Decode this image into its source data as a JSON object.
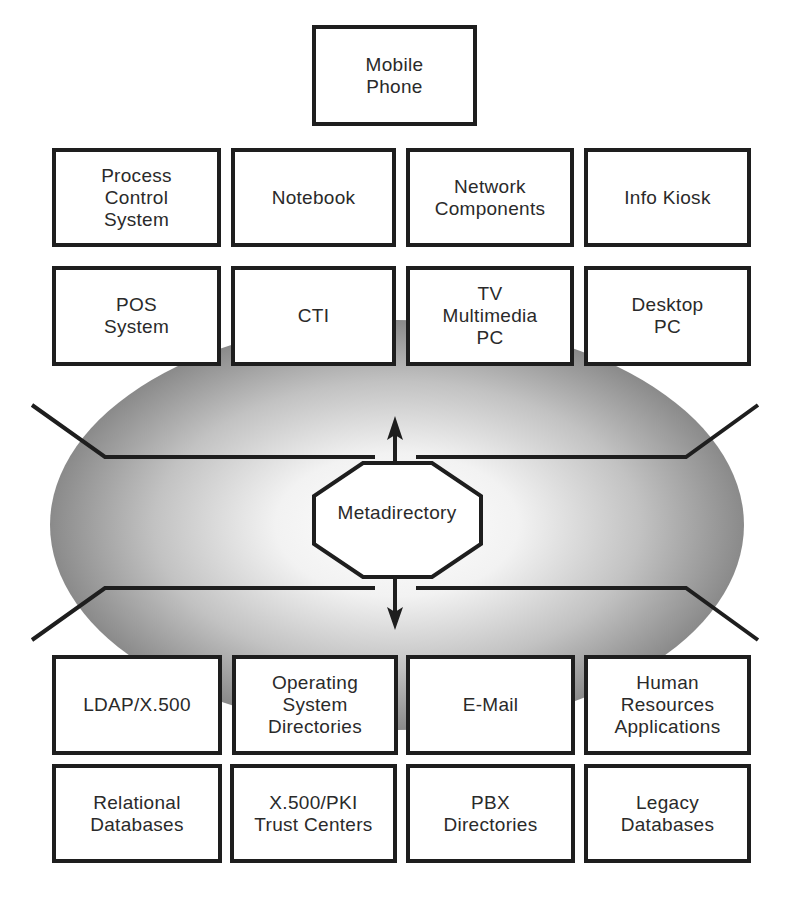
{
  "diagram": {
    "center": {
      "label": "Metadirectory",
      "shape": "octagon"
    },
    "ellipse": {
      "fill_edge": "#8a8a8a",
      "fill_center": "#ffffff"
    },
    "top_node": {
      "label": "Mobile\nPhone"
    },
    "client_rows": [
      [
        {
          "label": "Process\nControl\nSystem"
        },
        {
          "label": "Notebook"
        },
        {
          "label": "Network\nComponents"
        },
        {
          "label": "Info Kiosk"
        }
      ],
      [
        {
          "label": "POS\nSystem"
        },
        {
          "label": "CTI"
        },
        {
          "label": "TV\nMultimedia\nPC"
        },
        {
          "label": "Desktop\nPC"
        }
      ]
    ],
    "directory_rows": [
      [
        {
          "label": "LDAP/X.500"
        },
        {
          "label": "Operating\nSystem\nDirectories"
        },
        {
          "label": "E-Mail"
        },
        {
          "label": "Human\nResources\nApplications"
        }
      ],
      [
        {
          "label": "Relational\nDatabases"
        },
        {
          "label": "X.500/PKI\nTrust Centers"
        },
        {
          "label": "PBX\nDirectories"
        },
        {
          "label": "Legacy\nDatabases"
        }
      ]
    ],
    "arrows": [
      "up",
      "down"
    ],
    "colors": {
      "stroke": "#1e1e1e",
      "text": "#2a2a2a",
      "box_fill": "#ffffff"
    }
  }
}
